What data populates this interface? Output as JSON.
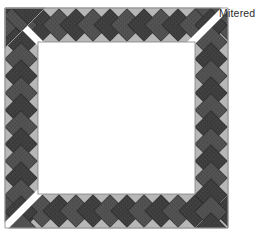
{
  "figure": {
    "type": "quilt-border-diagram",
    "title_label": "Mitered",
    "background_color": "#ffffff",
    "inner_field_color": "#ffffff"
  },
  "annotations": [
    {
      "name": "mitered-label",
      "text": "Mitered",
      "color": "#2b2b2b",
      "x": 219,
      "y": 7
    }
  ],
  "frame": {
    "outer": {
      "x": 5,
      "y": 8,
      "width": 223,
      "height": 220
    },
    "inner": {
      "x": 38,
      "y": 42,
      "width": 157,
      "height": 152
    },
    "band_color": "#b7b7b7",
    "band_edge_color": "#9a9a9a",
    "strip_width_px": 33,
    "miter_seam_color": "#ffffff",
    "miter_seam_width_px": 7,
    "mitered_corners": [
      "top-left",
      "top-right",
      "bottom-left"
    ],
    "continuous_corners": [
      "bottom-right"
    ]
  },
  "braid": {
    "description": "Zigzag braid of 45-degree rotated patchwork squares",
    "tile_dark_color": "#3c3c3c",
    "tile_mid_color": "#4f4f4f",
    "tile_light_color": "#5d5d5d",
    "tile_outline_color": "#2a2a2a",
    "tile_size_px": 23,
    "tile_pitch_px": 17,
    "rotation_deg": 45,
    "counts": {
      "top_strip_tiles": 11,
      "bottom_strip_tiles": 11,
      "left_strip_tiles": 11,
      "right_strip_tiles": 11,
      "top_left_corner_tiles": 4
    }
  },
  "colors": {
    "white": "#ffffff",
    "band_gray": "#b7b7b7",
    "band_gray_dark": "#9a9a9a",
    "tile_dark": "#3c3c3c",
    "tile_mid": "#4f4f4f",
    "tile_light": "#5d5d5d",
    "text": "#2b2b2b"
  }
}
